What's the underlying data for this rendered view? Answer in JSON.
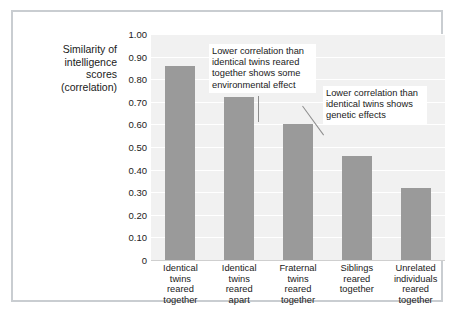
{
  "chart_data": {
    "type": "bar",
    "title": "",
    "ylabel": "Similarity of intelligence scores (correlation)",
    "xlabel": "",
    "categories": [
      "Identical twins reared together",
      "Identical twins reared apart",
      "Fraternal twins reared together",
      "Siblings reared together",
      "Unrelated individuals reared together"
    ],
    "values": [
      0.86,
      0.72,
      0.6,
      0.46,
      0.32
    ],
    "ylim": [
      0,
      1.0
    ],
    "ytick_labels": [
      "1.00",
      "0.90",
      "0.80",
      "0.70",
      "0.60",
      "0.50",
      "0.40",
      "0.30",
      "0.20",
      "0.10",
      "0"
    ],
    "ytick_values": [
      1.0,
      0.9,
      0.8,
      0.7,
      0.6,
      0.5,
      0.4,
      0.3,
      0.2,
      0.1,
      0
    ],
    "grid": true,
    "legend": "none",
    "bar_color": "#9a9a9a",
    "plot_background": "#f1f1f1",
    "gridline_color": "#ffffff",
    "annotations": [
      {
        "text": "Lower correlation than identical twins reared together shows some environmental effect",
        "points_to_category": "Identical twins reared apart",
        "leader": "vertical"
      },
      {
        "text": "Lower correlation than identical twins shows genetic effects",
        "points_to_category": "Fraternal twins reared together",
        "leader": "diagonal"
      }
    ]
  },
  "axis": {
    "y_title_lines": [
      "Similarity of",
      "intelligence",
      "scores",
      "(correlation)"
    ]
  },
  "categories_wrapped": [
    [
      "Identical",
      "twins",
      "reared",
      "together"
    ],
    [
      "Identical",
      "twins",
      "reared",
      "apart"
    ],
    [
      "Fraternal",
      "twins",
      "reared",
      "together"
    ],
    [
      "Siblings",
      "reared",
      "together"
    ],
    [
      "Unrelated",
      "individuals",
      "reared",
      "together"
    ]
  ]
}
